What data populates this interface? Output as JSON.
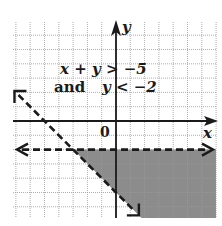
{
  "diagram": {
    "type": "inequality-graph",
    "system": {
      "line1": "x + y > −5",
      "line2_prefix": "and",
      "line2": "y < −2"
    },
    "axes": {
      "x_label": "x",
      "y_label": "y",
      "origin_label": "0",
      "x_range": [
        -7,
        7
      ],
      "y_range": [
        -7,
        7
      ]
    },
    "boundaries": [
      {
        "equation": "x + y = -5",
        "style": "dashed"
      },
      {
        "equation": "y = -2",
        "style": "dashed"
      }
    ],
    "shaded_region": "x + y > -5 and y < -2",
    "colors": {
      "grid": "#9a9a9a",
      "axis": "#1a1a1a",
      "shade": "#8c8c8c",
      "line": "#1a1a1a"
    }
  }
}
